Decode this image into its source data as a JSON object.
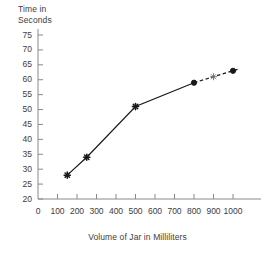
{
  "chart_data": {
    "type": "line",
    "title": "",
    "xlabel": "Volume of Jar in Milliliters",
    "ylabel": "Time in Seconds",
    "ylabel_line1": "Time in",
    "ylabel_line2": "Seconds",
    "xlim": [
      0,
      1000
    ],
    "ylim": [
      20,
      75
    ],
    "xticks": [
      0,
      100,
      200,
      300,
      400,
      500,
      600,
      700,
      800,
      900,
      1000
    ],
    "yticks": [
      20,
      25,
      30,
      35,
      40,
      45,
      50,
      55,
      60,
      65,
      70,
      75
    ],
    "xtick_labels": [
      "0",
      "100",
      "200",
      "300",
      "400",
      "500",
      "600",
      "700",
      "800",
      "900",
      "1000"
    ],
    "ytick_labels": [
      "20",
      "25",
      "30",
      "35",
      "40",
      "45",
      "50",
      "55",
      "60",
      "65",
      "70",
      "75"
    ],
    "grid": false,
    "legend": null,
    "x": [
      150,
      250,
      500,
      800,
      900,
      1000
    ],
    "y": [
      28,
      34,
      51,
      59,
      61,
      63
    ],
    "series": [
      {
        "name": "Time vs Volume",
        "points": [
          {
            "x": 150,
            "y": 28,
            "marker": "star",
            "filled": true
          },
          {
            "x": 250,
            "y": 34,
            "marker": "star",
            "filled": true
          },
          {
            "x": 500,
            "y": 51,
            "marker": "star",
            "filled": true
          },
          {
            "x": 800,
            "y": 59,
            "marker": "dot",
            "filled": true
          },
          {
            "x": 900,
            "y": 61,
            "marker": "star",
            "filled": false
          },
          {
            "x": 1000,
            "y": 63,
            "marker": "dot",
            "filled": true
          }
        ],
        "solid_segment": [
          150,
          800
        ],
        "dashed_segment": [
          800,
          1030
        ],
        "color": "#1a1a1a"
      }
    ],
    "colors": {
      "line": "#1a1a1a",
      "axis": "#8a8a8a",
      "text": "#3d3d3d",
      "background": "#ffffff"
    }
  }
}
